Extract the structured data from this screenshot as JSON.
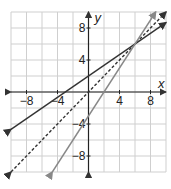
{
  "chart_data": {
    "type": "line",
    "title": "",
    "xlabel": "x",
    "ylabel": "y",
    "xlim": [
      -10,
      10
    ],
    "ylim": [
      -10,
      10
    ],
    "grid": true,
    "grid_step": 2,
    "x_ticks": [
      -8,
      -4,
      4,
      8
    ],
    "y_ticks": [
      8,
      4,
      -4,
      -8
    ],
    "x_tick_labels": [
      "−8",
      "−4",
      "4",
      "8"
    ],
    "y_tick_labels": [
      "8",
      "4",
      "−4",
      "−8"
    ],
    "series": [
      {
        "name": "line-solid-dark",
        "style": "solid",
        "color": "#333333",
        "equation": "y = (2/3)x + 2",
        "slope": 0.6667,
        "intercept": 2,
        "points": [
          [
            -10,
            -4.67
          ],
          [
            0,
            2
          ],
          [
            6,
            6
          ],
          [
            10,
            8.67
          ]
        ]
      },
      {
        "name": "line-dashed",
        "style": "dashed",
        "color": "#333333",
        "equation": "y = x",
        "slope": 1,
        "intercept": 0,
        "points": [
          [
            -10,
            -10
          ],
          [
            0,
            0
          ],
          [
            6,
            6
          ],
          [
            10,
            10
          ]
        ]
      },
      {
        "name": "line-solid-gray",
        "style": "solid",
        "color": "#888888",
        "equation": "y = 1.5x - 3",
        "slope": 1.5,
        "intercept": -3,
        "points": [
          [
            -4.67,
            -10
          ],
          [
            0,
            -3
          ],
          [
            6,
            6
          ],
          [
            8.67,
            10
          ]
        ]
      }
    ],
    "intersection": [
      6,
      6
    ]
  }
}
